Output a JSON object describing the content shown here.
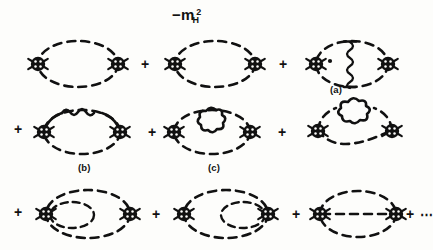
{
  "figure": {
    "background_color": "#fdfdfb",
    "ink_color": "#111111",
    "mass_label": {
      "minus": "−",
      "base": "m",
      "sub": "H",
      "sup": "2"
    },
    "ellipsis": "⋯",
    "plus_sign": "+",
    "diagram_labels": {
      "a": "(a)",
      "b": "(b)",
      "c": "(c)"
    },
    "rows": [
      {
        "row_index": 1,
        "leading_plus": false,
        "items": [
          {
            "id": "d1",
            "kind": "diagram",
            "name": "bubble-plain-1",
            "label": null,
            "description": "dashed ellipse loop with two crossed-circle vertex blobs"
          },
          {
            "id": "p1",
            "kind": "plus"
          },
          {
            "id": "d2",
            "kind": "diagram",
            "name": "bubble-plain-2",
            "label": null,
            "description": "dashed ellipse loop with two crossed-circle vertex blobs"
          },
          {
            "id": "p2",
            "kind": "plus"
          },
          {
            "id": "d3",
            "kind": "diagram",
            "name": "bubble-wavy-exchange",
            "label": "(a)",
            "description": "dashed ellipse with vertical wavy exchange line and small dot"
          }
        ]
      },
      {
        "row_index": 2,
        "leading_plus": true,
        "items": [
          {
            "id": "d4",
            "kind": "diagram",
            "name": "bubble-wavy-arc",
            "label": "(b)",
            "description": "dashed ellipse with solid arc containing wavy self-energy insertion"
          },
          {
            "id": "p3",
            "kind": "plus"
          },
          {
            "id": "d5",
            "kind": "diagram",
            "name": "bubble-cloud-inner",
            "label": "(c)",
            "description": "dashed ellipse with cloud blob loop inside upper region"
          },
          {
            "id": "p4",
            "kind": "plus"
          },
          {
            "id": "d6",
            "kind": "diagram",
            "name": "bubble-cloud-on-top",
            "label": null,
            "description": "dashed ellipse with cloud blob sitting on upper arc"
          }
        ]
      },
      {
        "row_index": 3,
        "leading_plus": true,
        "items": [
          {
            "id": "d7",
            "kind": "diagram",
            "name": "bubble-left-tadpole-loop",
            "label": null,
            "description": "dashed ellipse with small dashed loop attached at left vertex"
          },
          {
            "id": "p5",
            "kind": "plus"
          },
          {
            "id": "d8",
            "kind": "diagram",
            "name": "bubble-right-tadpole-loop",
            "label": null,
            "description": "dashed ellipse with small dashed loop attached at right vertex"
          },
          {
            "id": "p6",
            "kind": "plus"
          },
          {
            "id": "d9",
            "kind": "diagram",
            "name": "sunset-three-line",
            "label": null,
            "description": "dashed ellipse with horizontal dashed line through centre"
          },
          {
            "id": "p7",
            "kind": "plus"
          },
          {
            "id": "e1",
            "kind": "ellipsis"
          }
        ]
      }
    ]
  }
}
